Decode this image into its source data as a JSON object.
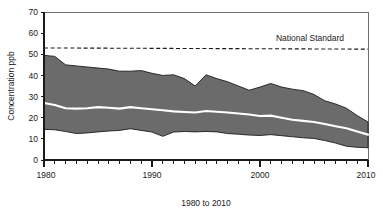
{
  "chart_data": {
    "type": "area",
    "title": "",
    "xlabel": "1980 to 2010",
    "ylabel": "Concentration ppb",
    "xlim": [
      1980,
      2010
    ],
    "ylim": [
      0,
      70
    ],
    "grid": false,
    "legend": "none",
    "x_tick_labels": [
      "1980",
      "1990",
      "2000",
      "2010"
    ],
    "x_tick_values": [
      1980,
      1990,
      2000,
      2010
    ],
    "y_tick_labels": [
      "0",
      "10",
      "20",
      "30",
      "40",
      "50",
      "60",
      "70"
    ],
    "y_tick_values": [
      0,
      10,
      20,
      30,
      40,
      50,
      60,
      70
    ],
    "x": [
      1980,
      1981,
      1982,
      1983,
      1984,
      1985,
      1986,
      1987,
      1988,
      1989,
      1990,
      1991,
      1992,
      1993,
      1994,
      1995,
      1996,
      1997,
      1998,
      1999,
      2000,
      2001,
      2002,
      2003,
      2004,
      2005,
      2006,
      2007,
      2008,
      2009,
      2010
    ],
    "series": [
      {
        "name": "90th Percentile",
        "values": [
          49.5,
          49.0,
          45.0,
          44.5,
          44.0,
          43.5,
          43.0,
          42.0,
          42.0,
          42.3,
          41.0,
          40.0,
          40.3,
          38.5,
          35.0,
          40.3,
          38.5,
          37.0,
          35.0,
          33.0,
          34.5,
          36.2,
          34.5,
          33.5,
          32.8,
          31.0,
          28.0,
          26.5,
          24.5,
          21.0,
          18.0
        ]
      },
      {
        "name": "Mean",
        "values": [
          27.0,
          26.0,
          24.5,
          24.3,
          24.5,
          25.0,
          24.7,
          24.3,
          25.0,
          24.5,
          24.0,
          23.5,
          23.0,
          22.7,
          22.5,
          23.2,
          22.8,
          22.5,
          22.0,
          21.5,
          20.8,
          21.0,
          20.0,
          19.0,
          18.5,
          18.0,
          17.0,
          16.0,
          15.0,
          13.5,
          12.0
        ]
      },
      {
        "name": "10th Percentile",
        "values": [
          14.5,
          14.3,
          13.5,
          12.5,
          12.8,
          13.3,
          13.7,
          14.0,
          14.8,
          14.0,
          13.2,
          11.2,
          13.2,
          13.5,
          13.3,
          13.5,
          13.3,
          12.5,
          12.2,
          11.8,
          11.6,
          12.0,
          11.5,
          11.0,
          10.5,
          10.2,
          9.2,
          8.0,
          6.5,
          6.0,
          5.8
        ]
      }
    ],
    "reference_line": {
      "label": "National Standard",
      "value": 53,
      "style": "dashed"
    },
    "colors": {
      "band_fill": "#6b6b6b",
      "band_edge": "#1c1c1c",
      "mean_line": "#ffffff",
      "axis": "#1a1a1a",
      "background": "#ffffff"
    }
  }
}
